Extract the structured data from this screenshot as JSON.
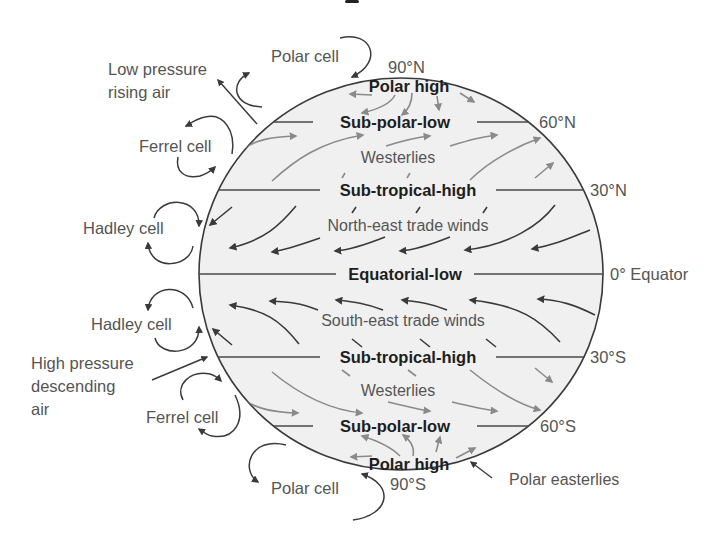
{
  "diagram": {
    "colors": {
      "globe_fill": "#f0f0f0",
      "globe_stroke": "#3a3a3a",
      "dark_arrow": "#3a3a3a",
      "grey_arrow": "#8a8a8a",
      "text": "#555555",
      "zone_text": "#1e1e1e"
    },
    "latitudes": {
      "n90": "90°N",
      "n60": "60°N",
      "n30": "30°N",
      "eq": "0° Equator",
      "s30": "30°S",
      "s60": "60°S",
      "s90": "90°S"
    },
    "pressure_zones": {
      "polar_high_n": "Polar high",
      "sub_polar_low_n": "Sub-polar-low",
      "sub_tropical_high_n": "Sub-tropical-high",
      "equatorial_low": "Equatorial-low",
      "sub_tropical_high_s": "Sub-tropical-high",
      "sub_polar_low_s": "Sub-polar-low",
      "polar_high_s": "Polar high"
    },
    "winds": {
      "westerlies_n": "Westerlies",
      "ne_trades": "North-east trade winds",
      "se_trades": "South-east trade winds",
      "westerlies_s": "Westerlies",
      "polar_easterlies": "Polar easterlies"
    },
    "cells": {
      "polar_n": "Polar cell",
      "ferrel_n": "Ferrel cell",
      "hadley_n": "Hadley cell",
      "hadley_s": "Hadley cell",
      "ferrel_s": "Ferrel cell",
      "polar_s": "Polar cell"
    },
    "annotations": {
      "low_pressure_line1": "Low pressure",
      "low_pressure_line2": "rising air",
      "high_pressure_line1": "High pressure",
      "high_pressure_line2": "descending",
      "high_pressure_line3": "air"
    }
  }
}
